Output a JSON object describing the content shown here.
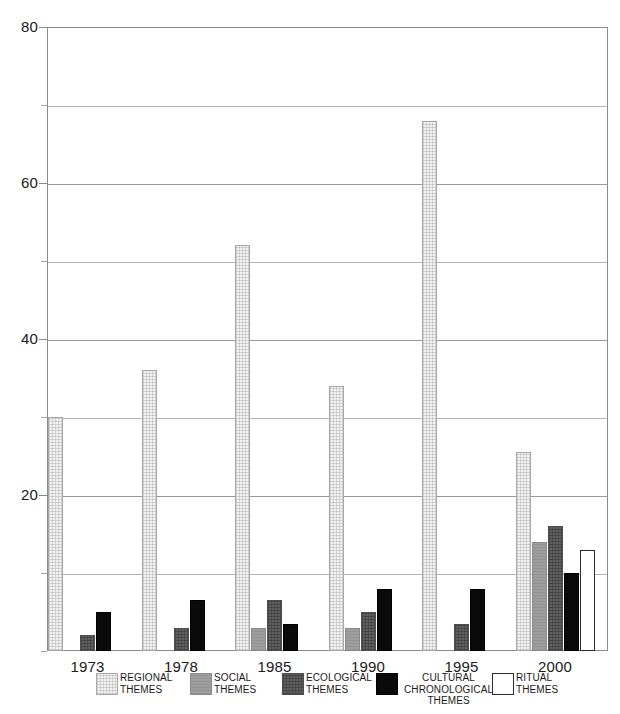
{
  "chart_data": {
    "type": "bar",
    "title": "",
    "subtitle": "",
    "xlabel": "",
    "ylabel": "",
    "ylim": [
      0,
      80
    ],
    "ytick_values": [
      0,
      10,
      20,
      30,
      40,
      50,
      60,
      70,
      80
    ],
    "ytick_labels_shown": [
      "20",
      "40",
      "60",
      "80"
    ],
    "grid": true,
    "grid_axis": "y",
    "legend_position": "bottom",
    "categories": [
      "1973",
      "1978",
      "1985",
      "1990",
      "1995",
      "2000"
    ],
    "series": [
      {
        "name": "REGIONAL\nTHEMES",
        "color": "#f2f2f2",
        "values": [
          30,
          36,
          52,
          34,
          68,
          25.5
        ]
      },
      {
        "name": "SOCIAL\nTHEMES",
        "color": "#9e9e9e",
        "values": [
          0,
          0,
          3,
          3,
          0,
          14
        ]
      },
      {
        "name": "ECOLOGICAL\nTHEMES",
        "color": "#5f5f5f",
        "values": [
          2,
          3,
          6.5,
          5,
          3.5,
          16
        ]
      },
      {
        "name": "CULTURAL\nCHRONOLOGICAL\nTHEMES",
        "color": "#0a0a0a",
        "values": [
          5,
          6.5,
          3.5,
          8,
          8,
          10
        ]
      },
      {
        "name": "RITUAL\nTHEMES",
        "color": "#ffffff",
        "values": [
          0,
          0,
          0,
          0,
          0,
          13
        ]
      }
    ]
  },
  "axis": {
    "y_labels": [
      {
        "value": 80,
        "text": "80"
      },
      {
        "value": 60,
        "text": "60"
      },
      {
        "value": 40,
        "text": "40"
      },
      {
        "value": 20,
        "text": "20"
      }
    ]
  },
  "legend": {
    "items": [
      {
        "label": "REGIONAL\nTHEMES",
        "color": "#f2f2f2",
        "swatch": "regional"
      },
      {
        "label": "SOCIAL\nTHEMES",
        "color": "#9e9e9e",
        "swatch": "social"
      },
      {
        "label": "ECOLOGICAL\nTHEMES",
        "color": "#5f5f5f",
        "swatch": "ecological"
      },
      {
        "label": "CULTURAL\nCHRONOLOGICAL\nTHEMES",
        "color": "#0a0a0a",
        "swatch": "cultural"
      },
      {
        "label": "RITUAL\nTHEMES",
        "color": "#ffffff",
        "swatch": "ritual"
      }
    ]
  }
}
